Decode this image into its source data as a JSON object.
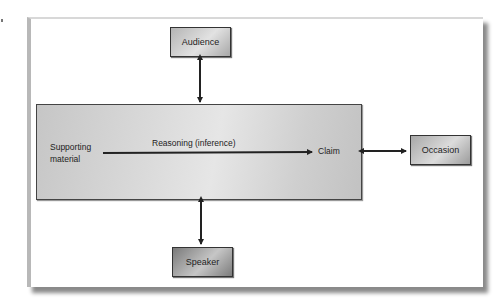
{
  "diagram": {
    "nodes": {
      "audience": "Audience",
      "occasion": "Occasion",
      "speaker": "Speaker"
    },
    "main": {
      "supporting_material": "Supporting material",
      "reasoning": "Reasoning (inference)",
      "claim": "Claim"
    },
    "edges": [
      {
        "from": "Audience",
        "to": "Main box",
        "type": "bidirectional"
      },
      {
        "from": "Speaker",
        "to": "Main box",
        "type": "bidirectional"
      },
      {
        "from": "Main box",
        "to": "Occasion",
        "type": "bidirectional"
      },
      {
        "from": "Supporting material",
        "to": "Claim",
        "type": "directed",
        "label": "Reasoning (inference)"
      }
    ]
  }
}
